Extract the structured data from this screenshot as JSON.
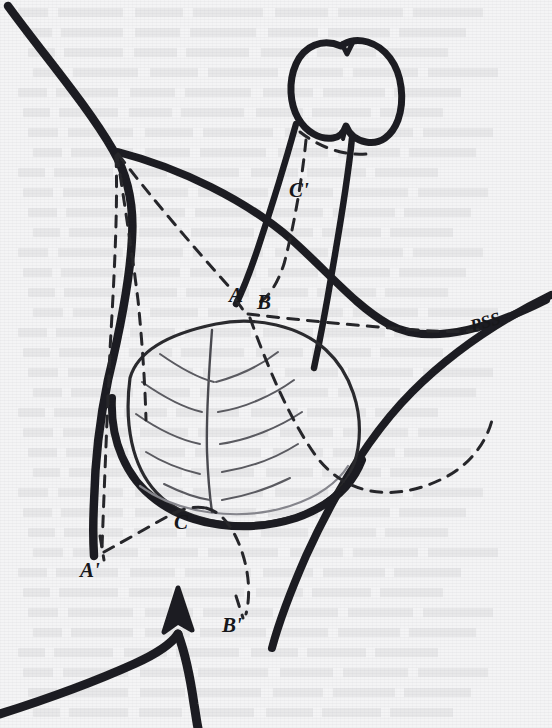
{
  "figure": {
    "kind": "anatomical-line-drawing",
    "background_color": "#f4f4f5",
    "ink_color": "#1a1a1d",
    "paper_note": "scanned book page with faint verso show-through text"
  },
  "labels": [
    {
      "id": "c-prime",
      "text": "C'",
      "x": 289,
      "y": 178,
      "size": "normal"
    },
    {
      "id": "a",
      "text": "A",
      "x": 229,
      "y": 283,
      "size": "normal"
    },
    {
      "id": "b",
      "text": "B",
      "x": 257,
      "y": 290,
      "size": "normal"
    },
    {
      "id": "pss",
      "text": "PSS",
      "x": 470,
      "y": 312,
      "size": "pss"
    },
    {
      "id": "c",
      "text": "C",
      "x": 174,
      "y": 510,
      "size": "normal"
    },
    {
      "id": "a-prime",
      "text": "A'",
      "x": 80,
      "y": 558,
      "size": "normal"
    },
    {
      "id": "b-prime",
      "text": "B'",
      "x": 222,
      "y": 613,
      "size": "normal"
    }
  ],
  "legend_keys": {
    "A": "flap apex point A",
    "B": "flap apex point B",
    "C": "flap apex point C",
    "A_prime": "transposed point A prime",
    "B_prime": "transposed point B prime",
    "C_prime": "transposed point C prime",
    "PSS": "penoscrotal skin / suspensory site marker"
  },
  "ghost_text_rows": [
    {
      "y": 8
    },
    {
      "y": 28
    },
    {
      "y": 48
    },
    {
      "y": 68
    },
    {
      "y": 88
    },
    {
      "y": 108
    },
    {
      "y": 128
    },
    {
      "y": 148
    },
    {
      "y": 168
    },
    {
      "y": 188
    },
    {
      "y": 208
    },
    {
      "y": 228
    },
    {
      "y": 248
    },
    {
      "y": 268
    },
    {
      "y": 288
    },
    {
      "y": 308
    },
    {
      "y": 328
    },
    {
      "y": 348
    },
    {
      "y": 368
    },
    {
      "y": 388
    },
    {
      "y": 408
    },
    {
      "y": 428
    },
    {
      "y": 448
    },
    {
      "y": 468
    },
    {
      "y": 488
    },
    {
      "y": 508
    },
    {
      "y": 528
    },
    {
      "y": 548
    },
    {
      "y": 568
    },
    {
      "y": 588
    },
    {
      "y": 608
    },
    {
      "y": 628
    },
    {
      "y": 648
    },
    {
      "y": 668
    },
    {
      "y": 688
    },
    {
      "y": 708
    }
  ]
}
